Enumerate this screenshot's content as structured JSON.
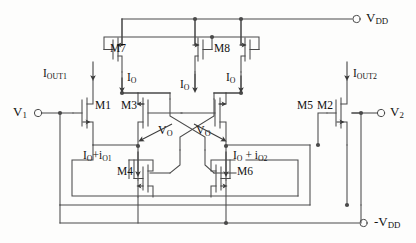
{
  "figure": {
    "kind": "circuit-schematic",
    "line_color": "#4a4a4a",
    "text_color": "#111111",
    "background": "#fdfdfc"
  },
  "supplies": {
    "positive": {
      "name": "VDD",
      "label_main": "V",
      "label_sub": "DD",
      "terminal": "open-circle"
    },
    "negative": {
      "name": "-VDD",
      "label_main": "-V",
      "label_sub": "DD",
      "terminal": "open-circle"
    }
  },
  "inputs": [
    {
      "id": "v1",
      "label_main": "V",
      "label_sub": "1",
      "terminal": "open-circle",
      "side": "left"
    },
    {
      "id": "v2",
      "label_main": "V",
      "label_sub": "2",
      "terminal": "open-circle",
      "side": "right"
    }
  ],
  "output_currents": [
    {
      "id": "iout1",
      "label_main": "I",
      "label_sub": "OUT1",
      "direction": "down"
    },
    {
      "id": "iout2",
      "label_main": "I",
      "label_sub": "OUT2",
      "direction": "down"
    }
  ],
  "bias_currents": [
    {
      "id": "io-m7",
      "label_main": "I",
      "label_sub": "O",
      "direction": "down"
    },
    {
      "id": "io-m8",
      "label_main": "I",
      "label_sub": "O",
      "direction": "down"
    },
    {
      "id": "io-m8b",
      "label_main": "I",
      "label_sub": "O",
      "direction": "down"
    }
  ],
  "branch_currents": [
    {
      "id": "branch-left",
      "text": "I",
      "sub1": "O",
      "plus": "+i",
      "sub2": "O1",
      "direction": "down"
    },
    {
      "id": "branch-right",
      "text": "I",
      "sub1": "O",
      "plus": " + i",
      "sub2": "O2",
      "direction": "down"
    }
  ],
  "node_voltages": [
    {
      "id": "vo-left",
      "label_main": "V",
      "label_sub": "O",
      "arrow": "down-left"
    },
    {
      "id": "vo-right",
      "label_main": "V",
      "label_sub": "O",
      "arrow": "down-right"
    }
  ],
  "transistors": [
    {
      "id": "M1",
      "label": "M1",
      "type": "nmos",
      "role": "input-left"
    },
    {
      "id": "M2",
      "label": "M2",
      "type": "nmos",
      "role": "input-right"
    },
    {
      "id": "M3",
      "label": "M3",
      "type": "nmos",
      "role": "cross-coupled-left-upper"
    },
    {
      "id": "M4",
      "label": "M4",
      "type": "pmos",
      "role": "cross-coupled-left-lower"
    },
    {
      "id": "M5",
      "label": "M5",
      "type": "nmos",
      "role": "cross-coupled-right-upper"
    },
    {
      "id": "M6",
      "label": "M6",
      "type": "pmos",
      "role": "cross-coupled-right-lower"
    },
    {
      "id": "M7",
      "label": "M7",
      "type": "pmos",
      "role": "mirror-output-left"
    },
    {
      "id": "M8",
      "label": "M8",
      "type": "pmos",
      "role": "mirror-diode-reference"
    }
  ]
}
